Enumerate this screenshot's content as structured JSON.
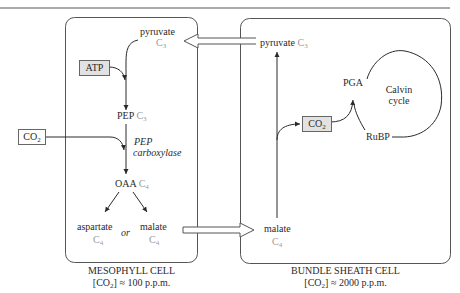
{
  "diagram": {
    "mesophyll": {
      "pyruvate": "pyruvate",
      "pyruvate_c": "C",
      "pyruvate_n": "3",
      "atp": "ATP",
      "pep": "PEP",
      "pep_c": "C",
      "pep_n": "3",
      "co2": "CO",
      "co2_n": "2",
      "enzyme_1": "PEP",
      "enzyme_2": "carboxylase",
      "oaa": "OAA",
      "oaa_c": "C",
      "oaa_n": "4",
      "aspartate": "aspartate",
      "aspartate_c": "C",
      "aspartate_n": "4",
      "or": "or",
      "malate": "malate",
      "malate_c": "C",
      "malate_n": "4",
      "caption_title": "MESOPHYLL CELL",
      "caption_conc_pre": "[CO",
      "caption_conc_n": "2",
      "caption_conc_post": "] ≈ 100 p.p.m."
    },
    "bundle_sheath": {
      "pyruvate": "pyruvate",
      "pyruvate_c": "C",
      "pyruvate_n": "3",
      "malate": "malate",
      "malate_c": "C",
      "malate_n": "4",
      "co2": "CO",
      "co2_n": "2",
      "pga": "PGA",
      "rubp": "RuBP",
      "cycle_1": "Calvin",
      "cycle_2": "cycle",
      "caption_title": "BUNDLE SHEATH CELL",
      "caption_conc_pre": "[CO",
      "caption_conc_n": "2",
      "caption_conc_post": "] ≈ 2000 p.p.m."
    },
    "colors": {
      "line": "#2a2a2a",
      "box_fill": "#e2e2e2",
      "subscript_gray": "#9a9a9a"
    }
  }
}
